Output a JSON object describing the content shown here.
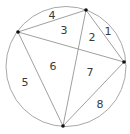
{
  "diagram": {
    "type": "circle-chord-partition",
    "colors": {
      "circle_stroke": "#a8a8a8",
      "chord_stroke": "#a0a0a0",
      "point_fill": "#111111",
      "label_fill": "#3a3a3a",
      "background": "#ffffff"
    },
    "circle": {
      "cx": 66,
      "cy": 66.5,
      "r": 60
    },
    "points": [
      {
        "id": "top",
        "x": 86,
        "y": 10
      },
      {
        "id": "left",
        "x": 18,
        "y": 32
      },
      {
        "id": "right",
        "x": 124,
        "y": 62
      },
      {
        "id": "bottom",
        "x": 63,
        "y": 126
      }
    ],
    "chords": [
      {
        "from": "left",
        "to": "top"
      },
      {
        "from": "top",
        "to": "right"
      },
      {
        "from": "left",
        "to": "right"
      },
      {
        "from": "top",
        "to": "bottom"
      },
      {
        "from": "left",
        "to": "bottom"
      },
      {
        "from": "right",
        "to": "bottom"
      }
    ],
    "regions": [
      {
        "label": "1",
        "x": 108,
        "y": 35
      },
      {
        "label": "2",
        "x": 92,
        "y": 41
      },
      {
        "label": "3",
        "x": 64,
        "y": 34
      },
      {
        "label": "4",
        "x": 52,
        "y": 19
      },
      {
        "label": "5",
        "x": 25,
        "y": 86
      },
      {
        "label": "6",
        "x": 53,
        "y": 70
      },
      {
        "label": "7",
        "x": 90,
        "y": 76
      },
      {
        "label": "8",
        "x": 100,
        "y": 108
      }
    ]
  }
}
